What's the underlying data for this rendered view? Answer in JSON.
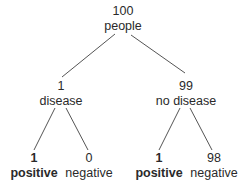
{
  "tree": {
    "root": {
      "count": "100",
      "label": "people"
    },
    "left": {
      "count": "1",
      "label": "disease",
      "children": [
        {
          "count": "1",
          "label": "positive",
          "bold": true
        },
        {
          "count": "0",
          "label": "negative",
          "bold": false
        }
      ]
    },
    "right": {
      "count": "99",
      "label": "no disease",
      "children": [
        {
          "count": "1",
          "label": "positive",
          "bold": true
        },
        {
          "count": "98",
          "label": "negative",
          "bold": false
        }
      ]
    }
  },
  "colors": {
    "line": "#555555",
    "text": "#2a2a2a",
    "background": "#ffffff"
  }
}
